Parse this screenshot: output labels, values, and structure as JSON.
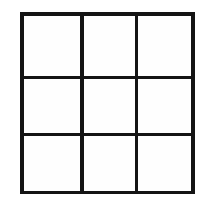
{
  "figure": {
    "kind": "grid-diagram",
    "rows": 3,
    "columns": 3,
    "cell_count": 9,
    "line_color": "#141414",
    "cell_fill_color": "#fefefe",
    "background_color": "#ffffff",
    "line_width_px": 3.5,
    "cells": [
      {
        "row": 1,
        "column": 1,
        "label": ""
      },
      {
        "row": 1,
        "column": 2,
        "label": ""
      },
      {
        "row": 1,
        "column": 3,
        "label": ""
      },
      {
        "row": 2,
        "column": 1,
        "label": ""
      },
      {
        "row": 2,
        "column": 2,
        "label": ""
      },
      {
        "row": 2,
        "column": 3,
        "label": ""
      },
      {
        "row": 3,
        "column": 1,
        "label": ""
      },
      {
        "row": 3,
        "column": 2,
        "label": ""
      },
      {
        "row": 3,
        "column": 3,
        "label": ""
      }
    ]
  }
}
